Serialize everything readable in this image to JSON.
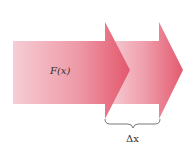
{
  "diagram": {
    "arrow1_label": "F(x)",
    "brace_label": "Δx",
    "colors": {
      "arrow_light": "#f4c6cf",
      "arrow_dark": "#e35a6f",
      "brace": "#555555",
      "text": "#333333"
    }
  }
}
